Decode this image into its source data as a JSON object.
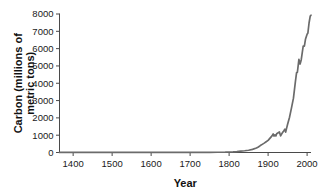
{
  "chart_data": {
    "type": "line",
    "title": "",
    "subtitle": "",
    "xlabel": "Year",
    "ylabel": "Carbon (millions of metric tons)",
    "ylabel_line1": "Carbon (millions of",
    "ylabel_line2": "metric tons)",
    "xlim": [
      1365,
      2010
    ],
    "ylim": [
      0,
      8000
    ],
    "grid": false,
    "legend": "none",
    "line_color": "#6b6b6b",
    "axis_color": "#4a4a4a",
    "xticks": [
      1400,
      1500,
      1600,
      1700,
      1800,
      1900,
      2000
    ],
    "xtick_labels": [
      "1400",
      "1500",
      "1600",
      "1700",
      "1800",
      "1900",
      "2000"
    ],
    "yticks": [
      0,
      1000,
      2000,
      3000,
      4000,
      5000,
      6000,
      7000,
      8000
    ],
    "ytick_labels": [
      "0",
      "1000",
      "2000",
      "3000",
      "4000",
      "5000",
      "6000",
      "7000",
      "8000"
    ],
    "series": [
      {
        "name": "Carbon emissions",
        "x": [
          1365,
          1400,
          1450,
          1500,
          1550,
          1600,
          1650,
          1700,
          1750,
          1770,
          1790,
          1800,
          1810,
          1820,
          1830,
          1840,
          1850,
          1860,
          1870,
          1875,
          1880,
          1885,
          1890,
          1895,
          1900,
          1905,
          1910,
          1913,
          1915,
          1918,
          1920,
          1922,
          1925,
          1929,
          1932,
          1935,
          1938,
          1940,
          1943,
          1945,
          1948,
          1950,
          1955,
          1960,
          1965,
          1970,
          1973,
          1975,
          1979,
          1982,
          1985,
          1990,
          1993,
          1996,
          2000,
          2002,
          2005,
          2008,
          2010
        ],
        "y": [
          3,
          4,
          5,
          6,
          7,
          8,
          9,
          10,
          12,
          15,
          20,
          30,
          40,
          55,
          75,
          100,
          130,
          180,
          260,
          320,
          400,
          470,
          540,
          620,
          700,
          830,
          960,
          1070,
          950,
          1010,
          960,
          1080,
          1130,
          1190,
          960,
          1080,
          1180,
          1240,
          1350,
          1180,
          1450,
          1630,
          2040,
          2580,
          3140,
          4090,
          4620,
          4620,
          5380,
          5110,
          5360,
          6150,
          6140,
          6560,
          6830,
          6900,
          7480,
          7880,
          7930
        ]
      }
    ],
    "annotations": []
  }
}
